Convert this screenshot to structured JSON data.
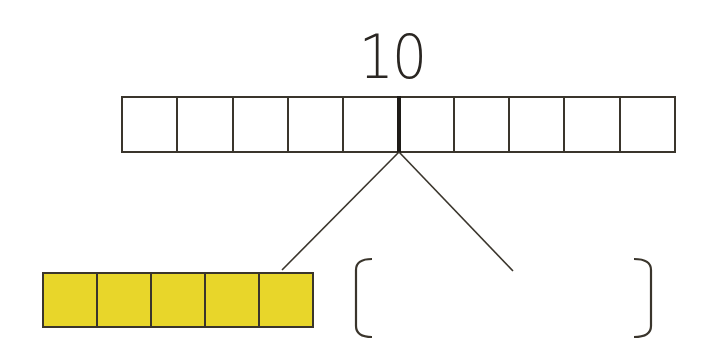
{
  "diagram": {
    "type": "number-bond-bar-model",
    "whole": {
      "label": "10",
      "cells": 10,
      "fill": "#ffffff",
      "split_after_cell": 5
    },
    "part_left": {
      "cells": 5,
      "fill": "#e8d62a"
    },
    "part_right": {
      "label": "",
      "shape": "empty-brackets",
      "left_bracket": "[",
      "right_bracket": "]"
    },
    "stroke_color": "#3a352c"
  }
}
